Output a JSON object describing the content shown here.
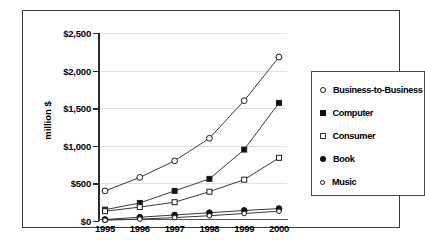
{
  "chart_data": {
    "type": "line",
    "title": "",
    "xlabel": "",
    "ylabel": "million $",
    "categories": [
      "1995",
      "1996",
      "1997",
      "1998",
      "1999",
      "2000"
    ],
    "x": [
      1995,
      1996,
      1997,
      1998,
      1999,
      2000
    ],
    "ylim": [
      0,
      2500
    ],
    "ytick_values": [
      0,
      500,
      1000,
      1500,
      2000,
      2500
    ],
    "ytick_labels": [
      "$0",
      "$500",
      "$1,000",
      "$1,500",
      "$2,000",
      "$2,500"
    ],
    "grid": true,
    "legend_position": "right",
    "series": [
      {
        "name": "Business-to-Business",
        "marker": "circle-open",
        "values": [
          400,
          580,
          800,
          1100,
          1600,
          2180
        ]
      },
      {
        "name": "Computer",
        "marker": "square-filled",
        "values": [
          150,
          240,
          400,
          560,
          950,
          1570
        ]
      },
      {
        "name": "Consumer",
        "marker": "square-open",
        "values": [
          130,
          185,
          250,
          390,
          550,
          840
        ]
      },
      {
        "name": "Book",
        "marker": "circle-filled",
        "values": [
          20,
          50,
          80,
          110,
          140,
          165
        ]
      },
      {
        "name": "Music",
        "marker": "circle-small-open",
        "values": [
          10,
          25,
          45,
          70,
          100,
          130
        ]
      }
    ]
  },
  "legend": {
    "items": [
      {
        "label": "Business-to-Business",
        "marker": "circle-open"
      },
      {
        "label": "Computer",
        "marker": "square-filled"
      },
      {
        "label": "Consumer",
        "marker": "square-open"
      },
      {
        "label": "Book",
        "marker": "circle-filled"
      },
      {
        "label": "Music",
        "marker": "circle-small-open"
      }
    ]
  },
  "colors": {
    "line": "#3a3a3a",
    "marker_fill": "#ffffff",
    "marker_stroke": "#1a1a1a",
    "grid": "#e2e2e2",
    "frame": "#3a3a3a",
    "text": "#000000"
  }
}
